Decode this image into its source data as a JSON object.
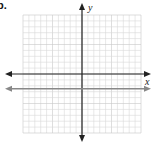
{
  "problem": {
    "label": "b."
  },
  "chart_data": {
    "type": "line",
    "title": "",
    "xlabel": "x",
    "ylabel": "y",
    "grid": true,
    "grid_cells": {
      "x": 20,
      "y": 20
    },
    "xlim": [
      -10,
      10
    ],
    "ylim": [
      -10,
      10
    ],
    "axes": {
      "x_axis_color": "#222222",
      "y_axis_color": "#222222"
    },
    "series": [
      {
        "name": "horizontal line",
        "color": "#888888",
        "equation": "y = -2.5",
        "x": [
          -10,
          10
        ],
        "values": [
          -2.5,
          -2.5
        ],
        "arrows": "both"
      }
    ]
  },
  "colors": {
    "grid": "#d9d9d9",
    "axis": "#222222",
    "line": "#8a8a8a"
  }
}
